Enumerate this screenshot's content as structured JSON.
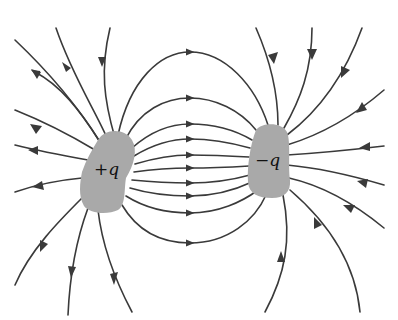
{
  "diagram": {
    "colors": {
      "line": "#3a3a3a",
      "charge_fill": "#a9a9a9",
      "label": "#111111",
      "background": "#ffffff"
    },
    "charges": [
      {
        "id": "positive",
        "label": "+q",
        "cx": 108,
        "cy": 172
      },
      {
        "id": "negative",
        "label": "−q",
        "cx": 266,
        "cy": 160
      }
    ],
    "connecting_lines": {
      "count": 10,
      "arrow_x": 190,
      "arrow_y": [
        52,
        98,
        124,
        139,
        155,
        168,
        183,
        196,
        213,
        243
      ],
      "direction": "from +q to -q"
    },
    "positive_outer_lines": {
      "count": 9,
      "direction": "outward"
    },
    "negative_outer_lines": {
      "count": 9,
      "direction": "inward"
    }
  }
}
